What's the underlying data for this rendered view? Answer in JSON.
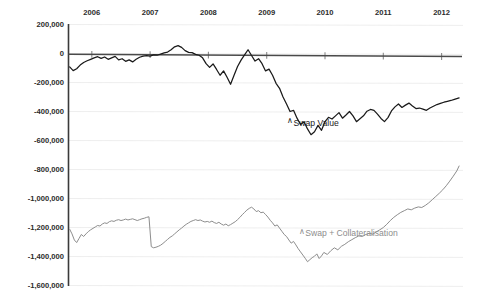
{
  "chart_data": {
    "type": "line",
    "title": "",
    "xlabel": "",
    "ylabel": "",
    "grid": true,
    "legend_position": "inline-annotation",
    "ylim": [
      -1600000,
      200000
    ],
    "ytick_values": [
      200000,
      0,
      -200000,
      -400000,
      -600000,
      -800000,
      -1000000,
      -1200000,
      -1400000,
      -1600000
    ],
    "ytick_labels": [
      "200,000",
      "0",
      "-200,000",
      "-400,000",
      "-600,000",
      "-800,000",
      "-1,000,000",
      "-1,200,000",
      "-1,400,000",
      "-1,600,000"
    ],
    "xtick_labels": [
      "2006",
      "2007",
      "2008",
      "2009",
      "2010",
      "2011",
      "2012"
    ],
    "xlim": [
      2005.6,
      2012.35
    ],
    "colors": {
      "swap_value": "#1a1a1a",
      "swap_collateralisation": "#8d8d8d",
      "gridline": "#ececec",
      "axis": "#3a3a3a",
      "background": "#ffffff",
      "text": "#2b2b2b"
    },
    "series": [
      {
        "name": "Swap Value",
        "color": "#1a1a1a",
        "label_x": 2009.35,
        "label_y": -480000,
        "x": [
          2005.62,
          2005.68,
          2005.74,
          2005.8,
          2005.86,
          2005.92,
          2005.98,
          2006.04,
          2006.1,
          2006.16,
          2006.22,
          2006.28,
          2006.34,
          2006.4,
          2006.46,
          2006.52,
          2006.58,
          2006.64,
          2006.7,
          2006.76,
          2006.82,
          2006.88,
          2006.94,
          2007.0,
          2007.06,
          2007.12,
          2007.18,
          2007.24,
          2007.3,
          2007.36,
          2007.42,
          2007.48,
          2007.54,
          2007.6,
          2007.66,
          2007.72,
          2007.78,
          2007.84,
          2007.9,
          2007.96,
          2008.02,
          2008.08,
          2008.14,
          2008.2,
          2008.26,
          2008.32,
          2008.38,
          2008.44,
          2008.5,
          2008.56,
          2008.62,
          2008.68,
          2008.74,
          2008.8,
          2008.86,
          2008.92,
          2008.98,
          2009.04,
          2009.1,
          2009.16,
          2009.22,
          2009.28,
          2009.34,
          2009.4,
          2009.46,
          2009.52,
          2009.58,
          2009.64,
          2009.7,
          2009.76,
          2009.82,
          2009.88,
          2009.94,
          2010.0,
          2010.06,
          2010.12,
          2010.18,
          2010.24,
          2010.3,
          2010.36,
          2010.42,
          2010.48,
          2010.54,
          2010.6,
          2010.66,
          2010.72,
          2010.78,
          2010.84,
          2010.9,
          2010.96,
          2011.02,
          2011.08,
          2011.14,
          2011.2,
          2011.26,
          2011.32,
          2011.38,
          2011.44,
          2011.5,
          2011.56,
          2011.62,
          2011.68,
          2011.74,
          2011.8,
          2011.86,
          2011.92,
          2011.98,
          2012.04,
          2012.1,
          2012.16,
          2012.22,
          2012.3
        ],
        "y": [
          -92000,
          -118000,
          -105000,
          -80000,
          -62000,
          -50000,
          -40000,
          -30000,
          -22000,
          -34000,
          -24000,
          -40000,
          -30000,
          -20000,
          -44000,
          -36000,
          -54000,
          -44000,
          -58000,
          -40000,
          -26000,
          -18000,
          -14000,
          -18000,
          -10000,
          -12000,
          -4000,
          4000,
          10000,
          26000,
          46000,
          54000,
          42000,
          20000,
          8000,
          6000,
          -6000,
          -12000,
          -30000,
          -70000,
          -96000,
          -72000,
          -110000,
          -150000,
          -120000,
          -164000,
          -212000,
          -150000,
          -90000,
          -46000,
          -10000,
          26000,
          -14000,
          -52000,
          -36000,
          -70000,
          -120000,
          -108000,
          -150000,
          -206000,
          -240000,
          -300000,
          -348000,
          -400000,
          -392000,
          -446000,
          -490000,
          -470000,
          -520000,
          -560000,
          -540000,
          -496000,
          -530000,
          -470000,
          -440000,
          -452000,
          -430000,
          -408000,
          -446000,
          -424000,
          -400000,
          -430000,
          -470000,
          -450000,
          -430000,
          -398000,
          -386000,
          -392000,
          -418000,
          -448000,
          -470000,
          -442000,
          -396000,
          -368000,
          -348000,
          -372000,
          -356000,
          -342000,
          -362000,
          -380000,
          -376000,
          -384000,
          -392000,
          -376000,
          -364000,
          -352000,
          -344000,
          -336000,
          -330000,
          -324000,
          -316000,
          -306000
        ]
      },
      {
        "name": "Swap + Collateralisation",
        "color": "#8d8d8d",
        "label_x": 2009.55,
        "label_y": -1244000,
        "x": [
          2005.62,
          2005.66,
          2005.7,
          2005.74,
          2005.78,
          2005.82,
          2005.86,
          2005.9,
          2005.94,
          2005.98,
          2006.02,
          2006.06,
          2006.1,
          2006.14,
          2006.18,
          2006.22,
          2006.26,
          2006.3,
          2006.34,
          2006.38,
          2006.42,
          2006.46,
          2006.5,
          2006.54,
          2006.58,
          2006.62,
          2006.66,
          2006.7,
          2006.74,
          2006.78,
          2006.82,
          2006.86,
          2006.9,
          2006.94,
          2006.98,
          2007.02,
          2007.06,
          2007.1,
          2007.14,
          2007.18,
          2007.22,
          2007.26,
          2007.3,
          2007.34,
          2007.38,
          2007.42,
          2007.46,
          2007.5,
          2007.54,
          2007.58,
          2007.62,
          2007.66,
          2007.7,
          2007.74,
          2007.78,
          2007.82,
          2007.86,
          2007.9,
          2007.94,
          2007.98,
          2008.02,
          2008.06,
          2008.1,
          2008.14,
          2008.18,
          2008.22,
          2008.26,
          2008.3,
          2008.34,
          2008.38,
          2008.42,
          2008.46,
          2008.5,
          2008.54,
          2008.58,
          2008.62,
          2008.66,
          2008.7,
          2008.74,
          2008.78,
          2008.82,
          2008.86,
          2008.9,
          2008.94,
          2008.98,
          2009.02,
          2009.06,
          2009.1,
          2009.14,
          2009.18,
          2009.22,
          2009.26,
          2009.3,
          2009.34,
          2009.38,
          2009.42,
          2009.46,
          2009.5,
          2009.54,
          2009.58,
          2009.62,
          2009.66,
          2009.7,
          2009.74,
          2009.78,
          2009.82,
          2009.86,
          2009.9,
          2009.94,
          2009.98,
          2010.04,
          2010.1,
          2010.16,
          2010.22,
          2010.28,
          2010.34,
          2010.4,
          2010.46,
          2010.52,
          2010.58,
          2010.64,
          2010.7,
          2010.76,
          2010.82,
          2010.88,
          2010.94,
          2011.0,
          2011.06,
          2011.12,
          2011.18,
          2011.24,
          2011.3,
          2011.36,
          2011.42,
          2011.48,
          2011.54,
          2011.6,
          2011.66,
          2011.72,
          2011.78,
          2011.84,
          2011.9,
          2011.96,
          2012.02,
          2012.08,
          2012.14,
          2012.2,
          2012.26,
          2012.3
        ],
        "y": [
          -1212000,
          -1244000,
          -1286000,
          -1304000,
          -1276000,
          -1248000,
          -1262000,
          -1244000,
          -1228000,
          -1216000,
          -1206000,
          -1196000,
          -1186000,
          -1190000,
          -1176000,
          -1168000,
          -1172000,
          -1160000,
          -1154000,
          -1158000,
          -1150000,
          -1146000,
          -1152000,
          -1148000,
          -1142000,
          -1148000,
          -1144000,
          -1140000,
          -1146000,
          -1152000,
          -1146000,
          -1140000,
          -1136000,
          -1130000,
          -1126000,
          -1332000,
          -1340000,
          -1336000,
          -1330000,
          -1322000,
          -1310000,
          -1296000,
          -1282000,
          -1268000,
          -1258000,
          -1244000,
          -1230000,
          -1216000,
          -1204000,
          -1190000,
          -1178000,
          -1168000,
          -1158000,
          -1152000,
          -1146000,
          -1152000,
          -1148000,
          -1156000,
          -1162000,
          -1158000,
          -1164000,
          -1156000,
          -1166000,
          -1172000,
          -1164000,
          -1176000,
          -1184000,
          -1176000,
          -1188000,
          -1180000,
          -1170000,
          -1160000,
          -1146000,
          -1130000,
          -1112000,
          -1096000,
          -1080000,
          -1068000,
          -1060000,
          -1072000,
          -1090000,
          -1084000,
          -1098000,
          -1094000,
          -1110000,
          -1128000,
          -1150000,
          -1168000,
          -1190000,
          -1182000,
          -1204000,
          -1226000,
          -1248000,
          -1262000,
          -1286000,
          -1308000,
          -1296000,
          -1320000,
          -1346000,
          -1368000,
          -1390000,
          -1412000,
          -1436000,
          -1422000,
          -1408000,
          -1398000,
          -1382000,
          -1414000,
          -1396000,
          -1372000,
          -1386000,
          -1360000,
          -1340000,
          -1354000,
          -1330000,
          -1316000,
          -1298000,
          -1284000,
          -1270000,
          -1258000,
          -1262000,
          -1248000,
          -1240000,
          -1246000,
          -1230000,
          -1216000,
          -1200000,
          -1178000,
          -1152000,
          -1130000,
          -1112000,
          -1096000,
          -1084000,
          -1072000,
          -1078000,
          -1066000,
          -1058000,
          -1062000,
          -1048000,
          -1030000,
          -1008000,
          -986000,
          -964000,
          -940000,
          -912000,
          -880000,
          -846000,
          -810000,
          -776000
        ]
      }
    ]
  },
  "legend": {
    "swap_value_label": "Swap Value",
    "swap_collateralisation_label": "Swap + Collateralisation",
    "marker_glyph": "∧"
  }
}
